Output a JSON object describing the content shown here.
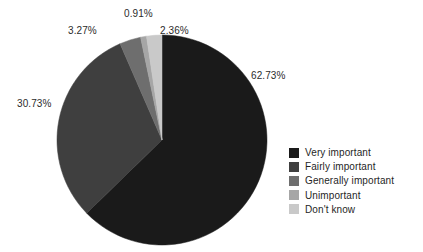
{
  "chart_data": {
    "type": "pie",
    "title": "",
    "subtitle": "",
    "xlabel": "",
    "ylabel": "",
    "grid": false,
    "legend_position": "right",
    "start_angle_deg": 0,
    "direction": "clockwise",
    "center": {
      "x": 162,
      "y": 140,
      "r": 105
    },
    "categories": [
      "Very important",
      "Fairly important",
      "Generally important",
      "Unimportant",
      "Don't know"
    ],
    "values": [
      62.73,
      30.73,
      3.27,
      0.91,
      2.36
    ],
    "labels": [
      "62.73%",
      "30.73%",
      "3.27%",
      "0.91%",
      "2.36%"
    ],
    "colors": [
      "#1a1a1a",
      "#3f3f3f",
      "#6e6e6e",
      "#a6a6a6",
      "#c9c9c9"
    ],
    "slices": [
      {
        "name": "Very important",
        "value": 62.73,
        "label": "62.73%",
        "color": "#1a1a1a"
      },
      {
        "name": "Fairly important",
        "value": 30.73,
        "label": "30.73%",
        "color": "#3f3f3f"
      },
      {
        "name": "Generally important",
        "value": 3.27,
        "label": "3.27%",
        "color": "#6e6e6e"
      },
      {
        "name": "Unimportant",
        "value": 0.91,
        "label": "0.91%",
        "color": "#a6a6a6"
      },
      {
        "name": "Don't know",
        "value": 2.36,
        "label": "2.36%",
        "color": "#c9c9c9"
      }
    ]
  },
  "labels": {
    "very_important": "62.73%",
    "fairly_important": "30.73%",
    "generally_important": "3.27%",
    "unimportant": "0.91%",
    "dont_know": "2.36%"
  },
  "legend": {
    "items": [
      {
        "label": "Very important",
        "color": "#1a1a1a"
      },
      {
        "label": "Fairly important",
        "color": "#3f3f3f"
      },
      {
        "label": "Generally important",
        "color": "#6e6e6e"
      },
      {
        "label": "Unimportant",
        "color": "#a6a6a6"
      },
      {
        "label": "Don't know",
        "color": "#c9c9c9"
      }
    ]
  }
}
